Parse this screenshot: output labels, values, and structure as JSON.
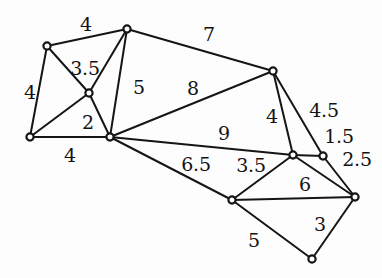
{
  "figure": {
    "background_color": "#fdfdfd",
    "stroke_color": "#151515",
    "node_fill_color": "#ffffff",
    "label_color": "#121212",
    "width": 382,
    "height": 278
  },
  "chart_data": {
    "type": "diagram",
    "diagram_kind": "weighted-undirected-graph",
    "title": "",
    "node_count": 11,
    "edge_count": 18,
    "nodes": [
      {
        "id": "n1",
        "label": "",
        "x": 47,
        "y": 46
      },
      {
        "id": "n2",
        "label": "",
        "x": 127,
        "y": 29
      },
      {
        "id": "n3",
        "label": "",
        "x": 89,
        "y": 93
      },
      {
        "id": "n4",
        "label": "",
        "x": 30,
        "y": 137
      },
      {
        "id": "n5",
        "label": "",
        "x": 110,
        "y": 137
      },
      {
        "id": "n6",
        "label": "",
        "x": 273,
        "y": 71
      },
      {
        "id": "n7",
        "label": "",
        "x": 293,
        "y": 155
      },
      {
        "id": "n8",
        "label": "",
        "x": 323,
        "y": 156
      },
      {
        "id": "n9",
        "label": "",
        "x": 232,
        "y": 200
      },
      {
        "id": "n10",
        "label": "",
        "x": 355,
        "y": 197
      },
      {
        "id": "n11",
        "label": "",
        "x": 312,
        "y": 259
      }
    ],
    "edges": [
      {
        "source": "n1",
        "target": "n2",
        "weight": "4",
        "label_x": 86,
        "label_y": 24
      },
      {
        "source": "n1",
        "target": "n4",
        "weight": "4",
        "label_x": 30,
        "label_y": 92
      },
      {
        "source": "n1",
        "target": "n3",
        "weight": "3.5",
        "label_x": 85,
        "label_y": 68
      },
      {
        "source": "n2",
        "target": "n3",
        "weight": "",
        "label_x": 0,
        "label_y": 0
      },
      {
        "source": "n2",
        "target": "n5",
        "weight": "5",
        "label_x": 139,
        "label_y": 87
      },
      {
        "source": "n2",
        "target": "n6",
        "weight": "7",
        "label_x": 209,
        "label_y": 34
      },
      {
        "source": "n3",
        "target": "n4",
        "weight": "",
        "label_x": 0,
        "label_y": 0
      },
      {
        "source": "n3",
        "target": "n5",
        "weight": "2",
        "label_x": 88,
        "label_y": 122
      },
      {
        "source": "n4",
        "target": "n5",
        "weight": "4",
        "label_x": 70,
        "label_y": 155
      },
      {
        "source": "n5",
        "target": "n6",
        "weight": "8",
        "label_x": 193,
        "label_y": 88
      },
      {
        "source": "n5",
        "target": "n7",
        "weight": "9",
        "label_x": 224,
        "label_y": 133
      },
      {
        "source": "n5",
        "target": "n9",
        "weight": "6.5",
        "label_x": 196,
        "label_y": 164
      },
      {
        "source": "n6",
        "target": "n7",
        "weight": "4",
        "label_x": 272,
        "label_y": 116
      },
      {
        "source": "n6",
        "target": "n8",
        "weight": "4.5",
        "label_x": 324,
        "label_y": 110
      },
      {
        "source": "n7",
        "target": "n8",
        "weight": "1.5",
        "label_x": 339,
        "label_y": 136
      },
      {
        "source": "n7",
        "target": "n9",
        "weight": "3.5",
        "label_x": 251,
        "label_y": 165
      },
      {
        "source": "n7",
        "target": "n10",
        "weight": "6",
        "label_x": 305,
        "label_y": 184
      },
      {
        "source": "n8",
        "target": "n10",
        "weight": "2.5",
        "label_x": 357,
        "label_y": 159
      },
      {
        "source": "n9",
        "target": "n10",
        "weight": "",
        "label_x": 0,
        "label_y": 0
      },
      {
        "source": "n9",
        "target": "n11",
        "weight": "5",
        "label_x": 254,
        "label_y": 240
      },
      {
        "source": "n10",
        "target": "n11",
        "weight": "3",
        "label_x": 320,
        "label_y": 224
      }
    ],
    "visible_weight_labels": [
      {
        "text": "4",
        "x": 86,
        "y": 24
      },
      {
        "text": "4",
        "x": 30,
        "y": 92
      },
      {
        "text": "3.5",
        "x": 85,
        "y": 68
      },
      {
        "text": "5",
        "x": 139,
        "y": 87
      },
      {
        "text": "7",
        "x": 209,
        "y": 34
      },
      {
        "text": "2",
        "x": 88,
        "y": 122
      },
      {
        "text": "4",
        "x": 70,
        "y": 155
      },
      {
        "text": "8",
        "x": 193,
        "y": 88
      },
      {
        "text": "9",
        "x": 224,
        "y": 133
      },
      {
        "text": "6.5",
        "x": 196,
        "y": 164
      },
      {
        "text": "4",
        "x": 272,
        "y": 116
      },
      {
        "text": "4.5",
        "x": 324,
        "y": 110
      },
      {
        "text": "1.5",
        "x": 339,
        "y": 136
      },
      {
        "text": "3.5",
        "x": 251,
        "y": 165
      },
      {
        "text": "6",
        "x": 305,
        "y": 184
      },
      {
        "text": "2.5",
        "x": 357,
        "y": 159
      },
      {
        "text": "5",
        "x": 254,
        "y": 240
      },
      {
        "text": "3",
        "x": 320,
        "y": 224
      }
    ]
  }
}
